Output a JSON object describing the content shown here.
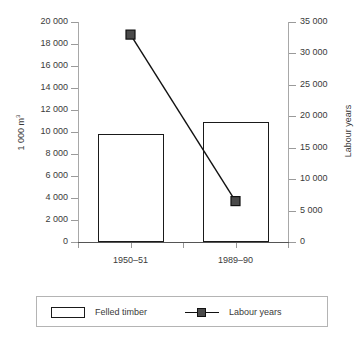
{
  "chart_data": {
    "type": "bar",
    "title": "",
    "categories": [
      "1950–51",
      "1989–90"
    ],
    "series": [
      {
        "name": "Felled timber",
        "type": "bar",
        "axis": "left",
        "values": [
          9800,
          10900
        ]
      },
      {
        "name": "Labour years",
        "type": "line",
        "axis": "right",
        "marker": "square",
        "values": [
          33000,
          6500
        ]
      }
    ],
    "xlabel": "",
    "ylabel": "1 000 m³",
    "ylabel_right": "Labour years",
    "ylim": [
      0,
      20000
    ],
    "ylim_right": [
      0,
      35000
    ],
    "yticks": [
      0,
      2000,
      4000,
      6000,
      8000,
      10000,
      12000,
      14000,
      16000,
      18000,
      20000
    ],
    "ytick_labels": [
      "0",
      "2 000",
      "4 000",
      "6 000",
      "8 000",
      "10 000",
      "12 000",
      "14 000",
      "16 000",
      "18 000",
      "20 000"
    ],
    "yticks_right": [
      0,
      5000,
      10000,
      15000,
      20000,
      25000,
      30000,
      35000
    ],
    "ytick_labels_right": [
      "0",
      "5 000",
      "10 000",
      "15 000",
      "20 000",
      "25 000",
      "30 000",
      "35 000"
    ],
    "grid": false,
    "legend_position": "bottom",
    "colors": {
      "bar_fill": "#ffffff",
      "bar_pattern": "#8d8d8d",
      "bar_border": "#1a1a1a",
      "line": "#111111",
      "marker_fill": "#4a4a4a",
      "axis": "#a8a8a8",
      "text": "#3a3a3a",
      "legend_border": "#b4b4b4"
    }
  },
  "axes": {
    "left_title_main": "1 000 m",
    "left_title_sup": "3",
    "right_title": "Labour years"
  },
  "legend": {
    "items": [
      {
        "label": "Felled timber",
        "swatch": "pattern-box"
      },
      {
        "label": "Labour years",
        "swatch": "line-square-marker"
      }
    ]
  }
}
